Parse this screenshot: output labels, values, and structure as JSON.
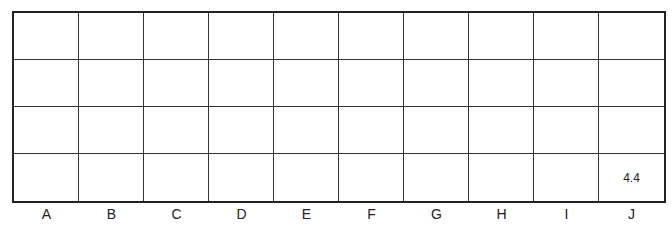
{
  "grid": {
    "rows": 4,
    "columns": [
      "A",
      "B",
      "C",
      "D",
      "E",
      "F",
      "G",
      "H",
      "I",
      "J"
    ],
    "cells": [
      [
        "",
        "",
        "",
        "",
        "",
        "",
        "",
        "",
        "",
        ""
      ],
      [
        "",
        "",
        "",
        "",
        "",
        "",
        "",
        "",
        "",
        ""
      ],
      [
        "",
        "",
        "",
        "",
        "",
        "",
        "",
        "",
        "",
        ""
      ],
      [
        "",
        "",
        "",
        "",
        "",
        "",
        "",
        "",
        "",
        "4.4"
      ]
    ]
  }
}
